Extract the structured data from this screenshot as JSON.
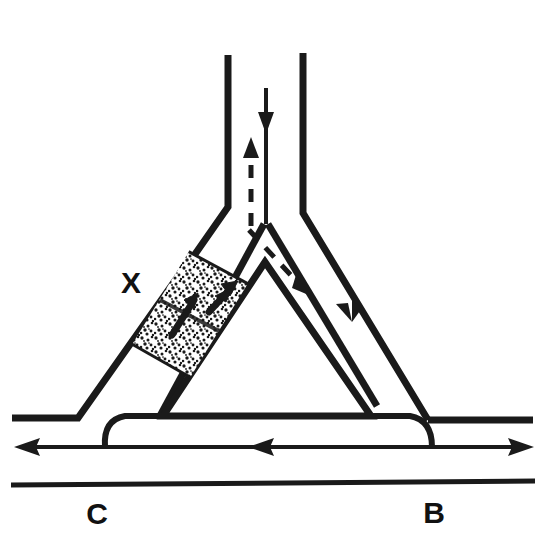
{
  "figure": {
    "background_color": "#ffffff",
    "ink_color": "#1a1a1a",
    "width": 544,
    "height": 550
  },
  "labels": {
    "zone_marker": "X",
    "left_reference": "C",
    "right_reference": "B"
  },
  "annotations": {
    "stipple_zone_name": "stippled-solids-zone",
    "stipple_fill_color": "#1a1a1a",
    "stipple_background": "#ffffff"
  },
  "flow_arrows": {
    "top_downward_solid": "downward-flow-arrow",
    "top_upward_dashed": "upward-dashed-flow-arrow",
    "apex_dashed_down_right": "dashed-branch-arrow",
    "right_channel_down": "right-channel-flow-arrow",
    "stipple_arrow_lower": "solids-motion-arrow-lower",
    "stipple_arrow_upper": "solids-motion-arrow-upper",
    "baseline_left": "left-flow-arrowhead",
    "baseline_middle": "middle-flow-arrowhead",
    "baseline_right": "right-flow-arrowhead"
  },
  "structure": {
    "left_vertical_wall": "left-riser-wall",
    "right_vertical_wall": "right-riser-wall",
    "left_diagonal_outer": "left-outer-diagonal-wall",
    "left_diagonal_inner": "left-inner-diagonal-wall",
    "right_diagonal_outer": "right-outer-diagonal-wall",
    "right_diagonal_inner": "right-inner-diagonal-wall",
    "inner_triangle": "inner-triangle-wall",
    "bottom_flow_line": "bottom-flow-line",
    "baseline": "bottom-baseline"
  }
}
